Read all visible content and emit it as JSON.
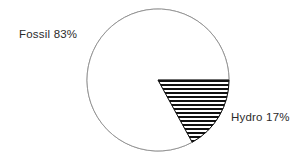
{
  "chart_data": {
    "type": "pie",
    "title": "",
    "xlabel": "",
    "ylabel": "",
    "legend_position": "none",
    "grid": false,
    "labels_position": "outside",
    "start_angle_deg": 0,
    "direction": "clockwise",
    "categories": [
      "Fossil",
      "Hydro"
    ],
    "values": [
      83,
      17
    ],
    "units": "%",
    "slices": [
      {
        "name": "Fossil",
        "value": 83,
        "label": "Fossil 83%",
        "fill": "none",
        "fill_color": "#ffffff",
        "stroke_color": "#8f8f8f",
        "start_angle_deg": 61.2,
        "end_angle_deg": 360
      },
      {
        "name": "Hydro",
        "value": 17,
        "label": "Hydro 17%",
        "fill": "horizontal-hatch",
        "fill_color": "#111111",
        "stroke_color": "#111111",
        "start_angle_deg": 0,
        "end_angle_deg": 61.2
      }
    ],
    "annotations": [
      {
        "text": "Fossil 83%",
        "anchor": "upper-left"
      },
      {
        "text": "Hydro 17%",
        "anchor": "right"
      }
    ]
  },
  "geometry": {
    "center_x": 158,
    "center_y": 80,
    "radius": 71
  },
  "colors": {
    "background": "#ffffff",
    "circle_stroke": "#8f8f8f",
    "hatch": "#111111",
    "text": "#2b2b2b"
  }
}
